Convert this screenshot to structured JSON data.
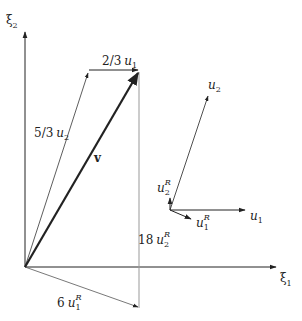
{
  "diagram": {
    "type": "vector-decomposition",
    "axes": {
      "x_label": "ξ",
      "x_sub": "1",
      "y_label": "ξ",
      "y_sub": "2"
    },
    "vectors": {
      "v": {
        "label": "v",
        "from": [
          25,
          267
        ],
        "to": [
          140,
          70
        ]
      },
      "five_thirds_u2": {
        "coef": "5/3",
        "sym": "u",
        "sub": "2",
        "from": [
          25,
          267
        ],
        "to": [
          89,
          70
        ]
      },
      "two_thirds_u1": {
        "coef": "2/3",
        "sym": "u",
        "sub": "1",
        "from": [
          89,
          70
        ],
        "to": [
          139,
          70
        ]
      },
      "six_u1R": {
        "coef": "6",
        "sym": "u",
        "sub": "1",
        "sup": "R",
        "from": [
          25,
          267
        ],
        "to": [
          139,
          308
        ]
      },
      "eighteen_u2R": {
        "coef": "18",
        "sym": "u",
        "sub": "2",
        "sup": "R",
        "from": [
          139,
          308
        ],
        "to": [
          139,
          70
        ]
      }
    },
    "basis_inset": {
      "origin": [
        170,
        210
      ],
      "u1": {
        "sym": "u",
        "sub": "1",
        "to": [
          246,
          210
        ]
      },
      "u2": {
        "sym": "u",
        "sub": "2",
        "to": [
          208,
          95
        ]
      },
      "u1R": {
        "sym": "u",
        "sub": "1",
        "sup": "R",
        "to": [
          191,
          219
        ]
      },
      "u2R": {
        "sym": "u",
        "sub": "2",
        "sup": "R",
        "to": [
          170,
          198
        ]
      }
    },
    "colors": {
      "ink": "#222222",
      "thin_line": "#444444",
      "gray_line": "#999999"
    }
  }
}
